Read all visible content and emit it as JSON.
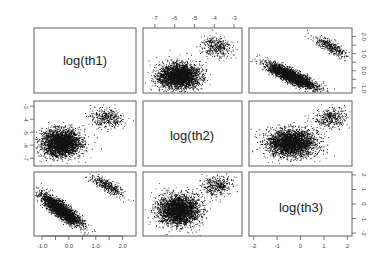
{
  "chart_data": {
    "type": "scatter",
    "subtype": "pairs-matrix",
    "title": "",
    "variables": [
      "log(th1)",
      "log(th2)",
      "log(th3)"
    ],
    "axes": {
      "log(th1)": {
        "range": [
          -1.3,
          2.5
        ],
        "ticks": [
          -1.0,
          -0.5,
          0.0,
          0.5,
          1.0,
          1.5,
          2.0
        ],
        "tick_labels": [
          "-1.0",
          "0.0",
          "1.0",
          "2.0"
        ]
      },
      "log(th2)": {
        "range": [
          -7.6,
          -2.6
        ],
        "ticks": [
          -7,
          -6,
          -5,
          -4,
          -3
        ],
        "tick_labels": [
          "-7",
          "-6",
          "-5",
          "-4",
          "-3"
        ]
      },
      "log(th3)": {
        "range": [
          -2.2,
          2.2
        ],
        "ticks": [
          -2,
          -1,
          0,
          1,
          2
        ],
        "tick_labels": [
          "-2",
          "-1",
          "0",
          "1",
          "2"
        ]
      }
    },
    "clusters": [
      {
        "name": "main",
        "weight": 0.9,
        "mean": {
          "log(th1)": -0.3,
          "log(th2)": -5.8,
          "log(th3)": -0.4
        },
        "sd": {
          "log(th1)": 0.35,
          "log(th2)": 0.5,
          "log(th3)": 0.5
        },
        "corr_th1_th3": -0.85
      },
      {
        "name": "secondary",
        "weight": 0.1,
        "mean": {
          "log(th1)": 1.4,
          "log(th2)": -3.9,
          "log(th3)": 1.3
        },
        "sd": {
          "log(th1)": 0.3,
          "log(th2)": 0.35,
          "log(th3)": 0.35
        },
        "corr_th1_th3": -0.8
      }
    ],
    "grid": false,
    "legend": null
  },
  "labels": {
    "diag1": "log(th1)",
    "diag2": "log(th2)",
    "diag3": "log(th3)"
  },
  "colors": {
    "points": "#111111",
    "frame": "#777777",
    "background": "#ffffff"
  }
}
